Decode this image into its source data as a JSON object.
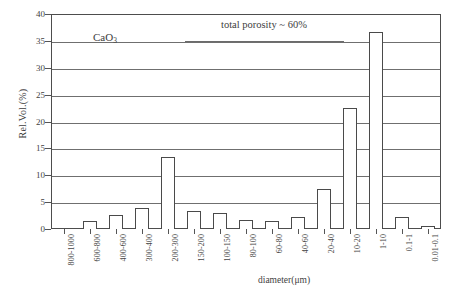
{
  "chart_data": {
    "type": "bar",
    "title": "",
    "xlabel": "diameter(μm)",
    "ylabel": "Rel.Vol.(%)",
    "ylim": [
      0,
      40
    ],
    "yticks": [
      0,
      5,
      10,
      15,
      20,
      25,
      30,
      35,
      40
    ],
    "grid": true,
    "legend": "none",
    "categories": [
      "800-1000",
      "600-800",
      "400-600",
      "300-400",
      "200-300",
      "150-200",
      "100-150",
      "80-100",
      "60-80",
      "40-60",
      "20-40",
      "10-20",
      "1-10",
      "0.1-1",
      "0.01-0.1"
    ],
    "values": [
      0,
      1.5,
      2.6,
      4.0,
      13.4,
      3.3,
      3.0,
      1.6,
      1.4,
      2.2,
      7.4,
      22.6,
      36.6,
      2.2,
      0.5
    ],
    "annotations": [
      {
        "text": "CaO3",
        "display": "CaO",
        "subscript": "3"
      },
      {
        "text": "total porosity ~ 60%"
      }
    ]
  },
  "axes": {
    "y_label": "Rel.Vol.(%)",
    "x_label": "diameter(μm)",
    "y_tick_labels": [
      "0",
      "5",
      "10",
      "15",
      "20",
      "25",
      "30",
      "35",
      "40"
    ]
  },
  "annotations": {
    "sample_label_base": "CaO",
    "sample_label_sub": "3",
    "porosity_note": "total porosity ~ 60%"
  },
  "colors": {
    "bar_fill": "#ffffff",
    "bar_stroke": "#4a4a4a",
    "gridline": "#6f6f6f",
    "axis": "#4d4d4d",
    "text": "#3d3d3d",
    "background": "#ffffff"
  }
}
